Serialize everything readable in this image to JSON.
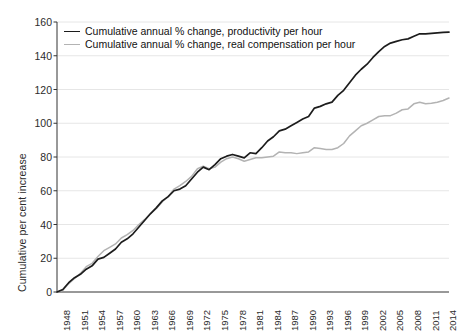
{
  "chart_data": {
    "type": "line",
    "title": "",
    "xlabel": "",
    "ylabel": "Cumulative per cent increase",
    "ylim": [
      0,
      160
    ],
    "xlim": [
      1948,
      2015
    ],
    "ytick_values": [
      0,
      20,
      40,
      60,
      80,
      100,
      120,
      140,
      160
    ],
    "ytick_labels": [
      "0",
      "20",
      "40",
      "60",
      "80",
      "100",
      "120",
      "140",
      "160"
    ],
    "xtick_labels": [
      "1948",
      "1951",
      "1954",
      "1957",
      "1960",
      "1963",
      "1966",
      "1969",
      "1972",
      "1975",
      "1978",
      "1981",
      "1984",
      "1987",
      "1990",
      "1993",
      "1996",
      "1999",
      "2002",
      "2005",
      "2008",
      "2011",
      "2014"
    ],
    "grid": "horizontal",
    "legend_position": "top-left",
    "x": [
      1948,
      1949,
      1950,
      1951,
      1952,
      1953,
      1954,
      1955,
      1956,
      1957,
      1958,
      1959,
      1960,
      1961,
      1962,
      1963,
      1964,
      1965,
      1966,
      1967,
      1968,
      1969,
      1970,
      1971,
      1972,
      1973,
      1974,
      1975,
      1976,
      1977,
      1978,
      1979,
      1980,
      1981,
      1982,
      1983,
      1984,
      1985,
      1986,
      1987,
      1988,
      1989,
      1990,
      1991,
      1992,
      1993,
      1994,
      1995,
      1996,
      1997,
      1998,
      1999,
      2000,
      2001,
      2002,
      2003,
      2004,
      2005,
      2006,
      2007,
      2008,
      2009,
      2010,
      2011,
      2012,
      2013,
      2014,
      2015
    ],
    "series": [
      {
        "name": "Cumulative annual % change, productivity per hour",
        "color": "#1c1c1c",
        "values": [
          0.0,
          1.5,
          5.5,
          8.5,
          10.5,
          13.5,
          15.5,
          19.5,
          20.5,
          23.0,
          25.5,
          29.5,
          31.5,
          34.5,
          38.5,
          42.5,
          46.5,
          50.0,
          54.0,
          56.5,
          60.0,
          61.0,
          63.0,
          67.0,
          71.0,
          74.0,
          72.5,
          75.5,
          79.0,
          80.5,
          81.5,
          80.5,
          79.5,
          82.5,
          82.0,
          85.5,
          89.5,
          92.0,
          95.5,
          96.5,
          98.5,
          100.5,
          102.5,
          104.0,
          109.0,
          110.0,
          111.5,
          112.5,
          116.5,
          119.5,
          124.0,
          128.5,
          132.0,
          135.0,
          139.0,
          142.5,
          145.5,
          147.5,
          148.5,
          149.5,
          150.0,
          151.5,
          153.0,
          153.0,
          153.3,
          153.6,
          153.8,
          154.0
        ]
      },
      {
        "name": "Cumulative annual % change, real compensation per hour",
        "color": "#b3b3b3",
        "values": [
          0.0,
          1.0,
          5.0,
          8.0,
          11.0,
          15.0,
          17.0,
          21.0,
          24.5,
          26.5,
          28.5,
          32.0,
          34.0,
          36.5,
          40.0,
          43.0,
          46.5,
          49.5,
          53.5,
          56.5,
          61.0,
          63.0,
          65.5,
          68.5,
          73.0,
          74.5,
          73.0,
          74.0,
          77.0,
          79.0,
          80.0,
          79.0,
          77.5,
          78.5,
          79.5,
          79.5,
          80.0,
          80.5,
          83.0,
          82.5,
          82.5,
          82.0,
          82.5,
          83.0,
          85.5,
          85.0,
          84.5,
          84.5,
          85.5,
          88.0,
          92.5,
          95.5,
          98.5,
          100.0,
          102.0,
          104.0,
          104.5,
          104.5,
          106.0,
          108.0,
          108.5,
          111.5,
          112.5,
          111.5,
          111.8,
          112.5,
          113.5,
          115.0
        ]
      }
    ]
  },
  "legend": {
    "items": [
      {
        "label": "Cumulative annual % change, productivity per hour",
        "color": "#1c1c1c",
        "width": "1.8px"
      },
      {
        "label": "Cumulative annual % change, real compensation per hour",
        "color": "#b3b3b3",
        "width": "1.4px"
      }
    ]
  },
  "axes": {
    "y_axis_title": "Cumulative per cent increase"
  },
  "colors": {
    "productivity_line": "#1c1c1c",
    "compensation_line": "#b3b3b3",
    "gridline": "#e6e6e6",
    "axis": "#333333",
    "background": "#ffffff"
  }
}
